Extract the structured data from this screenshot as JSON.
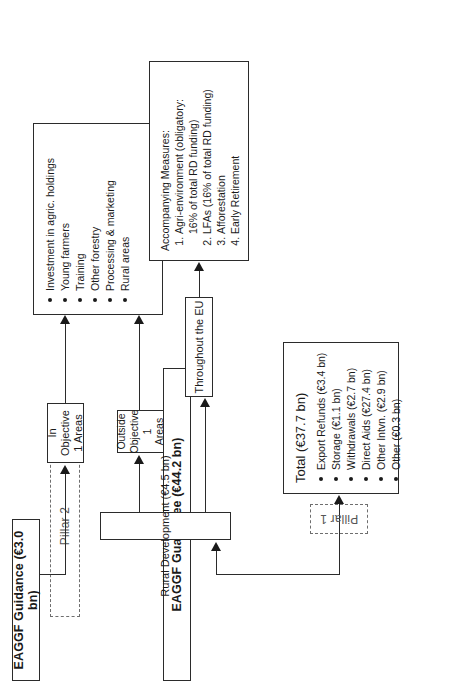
{
  "diagram": {
    "orientation": "rotated-90",
    "sources": [
      {
        "id": "guidance",
        "label": "EAGGF Guidance (€3.0 bn)"
      },
      {
        "id": "guarantee",
        "label": "EAGGF Guarantee (€44.2 bn)"
      }
    ],
    "pillars": [
      {
        "id": "pillar2",
        "label": "Pillar 2"
      },
      {
        "id": "pillar1",
        "label": "Pillar 1"
      }
    ],
    "nodes": {
      "rural_development": "Rural Development (€4.5 bn)",
      "in_objective_1": "In Objective\n1 Areas",
      "in_objective_1_lines": [
        "In Objective",
        "1 Areas"
      ],
      "outside_objective_1_lines": [
        "Outside",
        "Objective 1",
        "Areas"
      ],
      "throughout_eu": "Throughout the EU"
    },
    "measures_box": {
      "items": [
        "Investment in agric. holdings",
        "Young farmers",
        "Training",
        "Other forestry",
        "Processing & marketing",
        "Rural areas"
      ]
    },
    "accompanying_box": {
      "heading": "Accompanying Measures:",
      "items": [
        "Agri-environment (obligatory:\n16% of total RD funding)",
        "LFAs (16% of total RD funding)",
        "Afforestation",
        "Early Retirement"
      ],
      "item_lines": [
        [
          "Agri-environment (obligatory:",
          "16% of total RD funding)"
        ],
        [
          "LFAs (16% of total RD funding)"
        ],
        [
          "Afforestation"
        ],
        [
          "Early Retirement"
        ]
      ]
    },
    "total_box": {
      "heading": "Total (€37.7 bn)",
      "items": [
        "Export Refunds (€3.4 bn)",
        "Storage (€1.1 bn)",
        "Withdrawals (€2.7 bn)",
        "Direct Aids (€27.4 bn)",
        "Other Intvn. (€2.9 bn)",
        "Other (€0.3 bn)"
      ]
    },
    "colors": {
      "stroke": "#2b2b2b",
      "dashed_stroke": "#6e6e6e",
      "background": "#ffffff",
      "text": "#1a1a1a"
    }
  }
}
